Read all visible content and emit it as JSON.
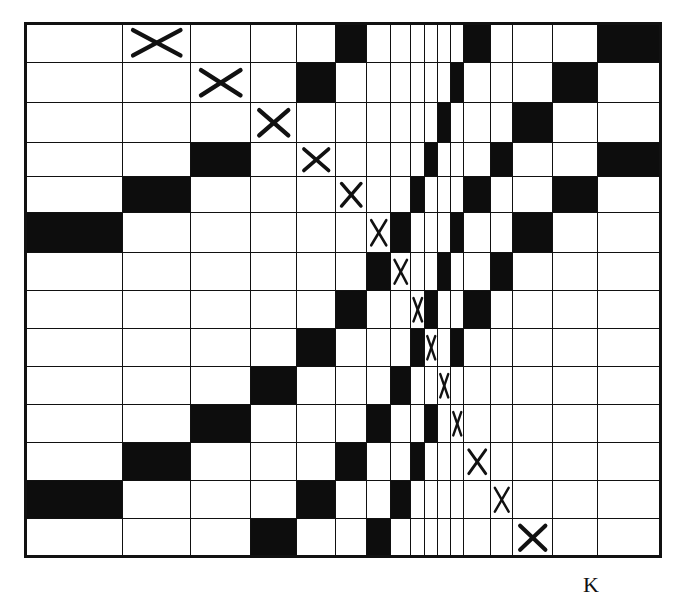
{
  "diagram": {
    "type": "grid-matrix",
    "rows": 14,
    "columns": 17,
    "column_edges": [
      24,
      122,
      190,
      250,
      296,
      335,
      366,
      390,
      410,
      424,
      437,
      450,
      463,
      490,
      512,
      552,
      597,
      660
    ],
    "row_edges": [
      22,
      62,
      102,
      142,
      176,
      212,
      252,
      290,
      328,
      366,
      404,
      442,
      480,
      518,
      556
    ],
    "cells": [
      {
        "row": 0,
        "black": [
          5,
          12,
          16
        ],
        "x": 1
      },
      {
        "row": 1,
        "black": [
          4,
          11,
          15
        ],
        "x": 2
      },
      {
        "row": 2,
        "black": [
          10,
          14
        ],
        "x": 3
      },
      {
        "row": 3,
        "black": [
          2,
          9,
          13,
          16
        ],
        "x": 4
      },
      {
        "row": 4,
        "black": [
          1,
          8,
          12,
          15
        ],
        "x": 5
      },
      {
        "row": 5,
        "black": [
          0,
          7,
          11,
          14
        ],
        "x": 6
      },
      {
        "row": 6,
        "black": [
          6,
          10,
          13
        ],
        "x": 7
      },
      {
        "row": 7,
        "black": [
          5,
          9,
          12
        ],
        "x": 8
      },
      {
        "row": 8,
        "black": [
          4,
          8,
          11
        ],
        "x": 9
      },
      {
        "row": 9,
        "black": [
          3,
          7
        ],
        "x": 10
      },
      {
        "row": 10,
        "black": [
          2,
          6,
          9
        ],
        "x": 11
      },
      {
        "row": 11,
        "black": [
          1,
          5,
          8
        ],
        "x": 12
      },
      {
        "row": 12,
        "black": [
          0,
          4,
          7
        ],
        "x": 13
      },
      {
        "row": 13,
        "black": [
          3,
          6
        ],
        "x": 14
      }
    ],
    "colors": {
      "fill": "#0d0d0d",
      "empty": "#ffffff",
      "line": "#111111"
    }
  },
  "label": {
    "text": "K"
  }
}
